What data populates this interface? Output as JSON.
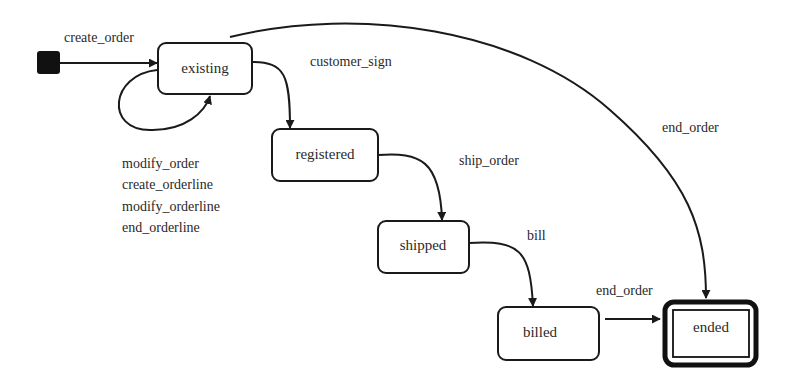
{
  "diagram": {
    "type": "state-machine",
    "initial_state": {
      "id": "initial",
      "target": "existing"
    },
    "states": [
      {
        "id": "existing",
        "label": "existing"
      },
      {
        "id": "registered",
        "label": "registered"
      },
      {
        "id": "shipped",
        "label": "shipped"
      },
      {
        "id": "billed",
        "label": "billed"
      },
      {
        "id": "ended",
        "label": "ended",
        "final": true
      }
    ],
    "transitions": [
      {
        "from": "initial",
        "to": "existing",
        "label": "create_order"
      },
      {
        "from": "existing",
        "to": "existing",
        "labels": [
          "modify_order",
          "create_orderline",
          "modify_orderline",
          "end_orderline"
        ]
      },
      {
        "from": "existing",
        "to": "registered",
        "label": "customer_sign"
      },
      {
        "from": "registered",
        "to": "shipped",
        "label": "ship_order"
      },
      {
        "from": "shipped",
        "to": "billed",
        "label": "bill"
      },
      {
        "from": "billed",
        "to": "ended",
        "label": "end_order"
      },
      {
        "from": "existing",
        "to": "ended",
        "label": "end_order"
      }
    ]
  },
  "labels": {
    "existing": "existing",
    "registered": "registered",
    "shipped": "shipped",
    "billed": "billed",
    "ended": "ended",
    "create_order": "create_order",
    "customer_sign": "customer_sign",
    "ship_order": "ship_order",
    "bill": "bill",
    "end_order_billed": "end_order",
    "end_order_existing": "end_order",
    "self_loop": [
      "modify_order",
      "create_orderline",
      "modify_orderline",
      "end_orderline"
    ]
  },
  "colors": {
    "stroke": "#1a1a1a",
    "text": "#2a2a2a",
    "background": "#ffffff"
  }
}
